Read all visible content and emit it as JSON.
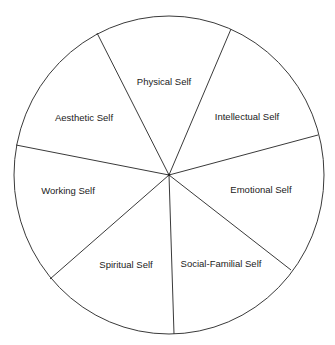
{
  "diagram": {
    "type": "segmented-wheel",
    "center": {
      "x": 169,
      "y": 175
    },
    "radius": {
      "x": 155,
      "y": 159
    },
    "line_color": "#3a3a3a",
    "background": "#ffffff",
    "dividers": [
      {
        "x": 97,
        "y": 33
      },
      {
        "x": 231,
        "y": 29
      },
      {
        "x": 318,
        "y": 135
      },
      {
        "x": 291,
        "y": 270
      },
      {
        "x": 174,
        "y": 334
      },
      {
        "x": 50,
        "y": 279
      },
      {
        "x": 16,
        "y": 145
      }
    ],
    "segments": [
      {
        "label": "Physical Self",
        "x": 164,
        "y": 82
      },
      {
        "label": "Intellectual Self",
        "x": 247,
        "y": 117
      },
      {
        "label": "Emotional Self",
        "x": 261,
        "y": 190
      },
      {
        "label": "Social-Familial Self",
        "x": 221,
        "y": 264
      },
      {
        "label": "Spiritual Self",
        "x": 126,
        "y": 265
      },
      {
        "label": "Working Self",
        "x": 68,
        "y": 191
      },
      {
        "label": "Aesthetic Self",
        "x": 84,
        "y": 118
      }
    ]
  }
}
